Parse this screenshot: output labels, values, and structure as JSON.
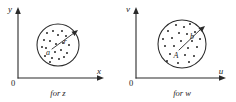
{
  "figure": {
    "background_color": "#ffffff",
    "ink_color": "#2a2a2a",
    "panels": [
      {
        "id": "z",
        "caption": "for z",
        "y_axis_label": "y",
        "x_axis_label": "x",
        "origin_label": "0",
        "center_label": "a",
        "radius_label": "r",
        "region": {
          "center_x": 58,
          "center_y": 45,
          "radius": 21
        },
        "center_point": {
          "x": 51,
          "y": 51
        },
        "radius_arrow": {
          "x1": 52,
          "y1": 49,
          "x2": 74,
          "y2": 33
        },
        "dots": [
          {
            "x": 47,
            "y": 33
          },
          {
            "x": 53,
            "y": 31
          },
          {
            "x": 58,
            "y": 35
          },
          {
            "x": 62,
            "y": 31
          },
          {
            "x": 66,
            "y": 36
          },
          {
            "x": 44,
            "y": 40
          },
          {
            "x": 50,
            "y": 41
          },
          {
            "x": 56,
            "y": 44
          },
          {
            "x": 63,
            "y": 43
          },
          {
            "x": 69,
            "y": 45
          },
          {
            "x": 42,
            "y": 47
          },
          {
            "x": 46,
            "y": 48
          },
          {
            "x": 55,
            "y": 52
          },
          {
            "x": 61,
            "y": 50
          },
          {
            "x": 67,
            "y": 53
          },
          {
            "x": 45,
            "y": 56
          },
          {
            "x": 52,
            "y": 58
          },
          {
            "x": 59,
            "y": 59
          },
          {
            "x": 64,
            "y": 57
          },
          {
            "x": 50,
            "y": 62
          }
        ]
      },
      {
        "id": "w",
        "caption": "for w",
        "y_axis_label": "v",
        "x_axis_label": "u",
        "origin_label": "0",
        "center_label": "A",
        "radius_label": "b",
        "region": {
          "center_x": 64,
          "center_y": 44,
          "radius": 24
        },
        "center_point": {
          "x": 60,
          "y": 52
        },
        "radius_arrow": {
          "x1": 61,
          "y1": 50,
          "x2": 83,
          "y2": 29
        },
        "dots": [
          {
            "x": 58,
            "y": 25
          },
          {
            "x": 66,
            "y": 27
          },
          {
            "x": 72,
            "y": 24
          },
          {
            "x": 50,
            "y": 31
          },
          {
            "x": 61,
            "y": 33
          },
          {
            "x": 69,
            "y": 34
          },
          {
            "x": 77,
            "y": 32
          },
          {
            "x": 45,
            "y": 39
          },
          {
            "x": 54,
            "y": 38
          },
          {
            "x": 63,
            "y": 41
          },
          {
            "x": 74,
            "y": 41
          },
          {
            "x": 82,
            "y": 39
          },
          {
            "x": 47,
            "y": 46
          },
          {
            "x": 56,
            "y": 46
          },
          {
            "x": 70,
            "y": 48
          },
          {
            "x": 79,
            "y": 47
          },
          {
            "x": 52,
            "y": 54
          },
          {
            "x": 67,
            "y": 55
          },
          {
            "x": 76,
            "y": 56
          },
          {
            "x": 49,
            "y": 61
          },
          {
            "x": 60,
            "y": 63
          },
          {
            "x": 71,
            "y": 62
          }
        ]
      }
    ]
  }
}
